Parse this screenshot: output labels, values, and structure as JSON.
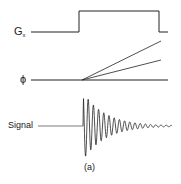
{
  "diagram": {
    "rows": [
      {
        "id": "gradient",
        "label": "G",
        "subscript": "x"
      },
      {
        "id": "phase",
        "label": "ϕ"
      },
      {
        "id": "signal",
        "label": "Signal"
      }
    ],
    "caption": "(a)",
    "colors": {
      "line": "#222222",
      "background": "#ffffff"
    }
  }
}
